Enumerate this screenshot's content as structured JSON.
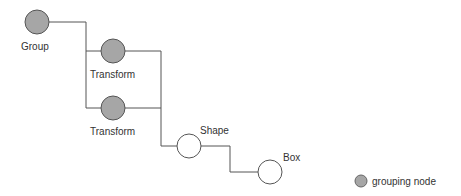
{
  "diagram": {
    "type": "scene-graph-tree",
    "nodes": [
      {
        "id": "group",
        "label": "Group",
        "kind": "grouping"
      },
      {
        "id": "transform1",
        "label": "Transform",
        "kind": "grouping"
      },
      {
        "id": "transform2",
        "label": "Transform",
        "kind": "grouping"
      },
      {
        "id": "shape",
        "label": "Shape",
        "kind": "leaf"
      },
      {
        "id": "box",
        "label": "Box",
        "kind": "leaf"
      }
    ],
    "edges": [
      {
        "from": "group",
        "to": "transform1"
      },
      {
        "from": "group",
        "to": "transform2"
      },
      {
        "from": "transform1",
        "to": "shape"
      },
      {
        "from": "transform2",
        "to": "shape"
      },
      {
        "from": "shape",
        "to": "box"
      }
    ],
    "colors": {
      "grouping_fill": "#a6a6a6",
      "leaf_fill": "#ffffff",
      "stroke": "#555555"
    }
  },
  "legend": {
    "label": "grouping node"
  }
}
